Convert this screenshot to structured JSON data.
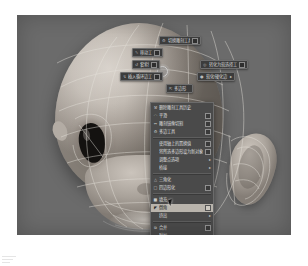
{
  "app": {
    "viewport_background": "#6b6b6b",
    "menu_background": "#4a4a4a",
    "menu_border": "#6b6b6b",
    "highlight_color": "#b9b4ac",
    "text_color": "#dedede"
  },
  "marking_menu": {
    "name": "marking-menu",
    "center_label": "",
    "items": [
      {
        "id": "mm-top",
        "icon": "wrench-icon",
        "label": "切换雕刻工具",
        "has_box": true,
        "left": 142,
        "top": 21,
        "width": 42
      },
      {
        "id": "mm-upper-left",
        "icon": "brush-icon",
        "label": "移动工具",
        "has_box": true,
        "left": 115,
        "top": 33,
        "width": 31
      },
      {
        "id": "mm-left-2",
        "icon": "lasso-icon",
        "label": "套索键",
        "has_box": true,
        "left": 115,
        "top": 45,
        "width": 28
      },
      {
        "id": "mm-left-3",
        "icon": "insert-icon",
        "label": "插入循环边工具",
        "has_box": true,
        "left": 103,
        "top": 57,
        "width": 43
      },
      {
        "id": "mm-right-1",
        "icon": "target-icon",
        "label": "转化为软选择工具",
        "has_box": true,
        "left": 183,
        "top": 45,
        "width": 48
      },
      {
        "id": "mm-right-2",
        "icon": "paint-icon",
        "label": "软化/硬化边",
        "has_box": false,
        "left": 180,
        "top": 57,
        "width": 38
      },
      {
        "id": "mm-bottom",
        "icon": "arrow-icon",
        "label": "多边形",
        "has_box": false,
        "left": 149,
        "top": 69,
        "width": 27
      }
    ]
  },
  "context_menu": {
    "name": "polygon-context-menu",
    "items": [
      {
        "id": "ci-1",
        "icon": "sculpt-icon",
        "label": "删除雕刻工具历史",
        "box": false,
        "arrow": false,
        "indent": false,
        "selected": false,
        "separator_after": false
      },
      {
        "id": "ci-2",
        "icon": "smooth-icon",
        "label": "平滑",
        "box": true,
        "arrow": false,
        "indent": false,
        "selected": false,
        "separator_after": false
      },
      {
        "id": "ci-3",
        "icon": "mirror-icon",
        "label": "雕刻镜像切割",
        "box": true,
        "arrow": false,
        "indent": false,
        "selected": false,
        "separator_after": false
      },
      {
        "id": "ci-4",
        "icon": "tool-icon",
        "label": "多边工具",
        "box": true,
        "arrow": false,
        "indent": false,
        "selected": false,
        "separator_after": true
      },
      {
        "id": "ci-5",
        "icon": "",
        "label": "使用轴上的置换值",
        "box": true,
        "arrow": false,
        "indent": true,
        "selected": false,
        "separator_after": false
      },
      {
        "id": "ci-6",
        "icon": "",
        "label": "将所选多边形设为新对象",
        "box": true,
        "arrow": false,
        "indent": true,
        "selected": false,
        "separator_after": false
      },
      {
        "id": "ci-7",
        "icon": "",
        "label": "调整点选项",
        "box": false,
        "arrow": true,
        "indent": true,
        "selected": false,
        "separator_after": false
      },
      {
        "id": "ci-8",
        "icon": "",
        "label": "桥接",
        "box": false,
        "arrow": true,
        "indent": true,
        "selected": false,
        "separator_after": true
      },
      {
        "id": "ci-9",
        "icon": "tri-icon",
        "label": "三角化",
        "box": false,
        "arrow": false,
        "indent": false,
        "selected": false,
        "separator_after": false
      },
      {
        "id": "ci-10",
        "icon": "quad-icon",
        "label": "四边形化",
        "box": true,
        "arrow": false,
        "indent": false,
        "selected": false,
        "separator_after": true
      },
      {
        "id": "ci-11",
        "icon": "fill-icon",
        "label": "填充",
        "box": false,
        "arrow": false,
        "indent": false,
        "selected": false,
        "separator_after": false
      },
      {
        "id": "ci-12",
        "icon": "bevel-icon",
        "label": "倒角",
        "box": true,
        "arrow": false,
        "indent": false,
        "selected": true,
        "separator_after": false
      },
      {
        "id": "ci-13",
        "icon": "",
        "label": "挤出",
        "box": false,
        "arrow": true,
        "indent": true,
        "selected": false,
        "separator_after": true
      },
      {
        "id": "ci-14",
        "icon": "merge-icon",
        "label": "合并",
        "box": true,
        "arrow": false,
        "indent": false,
        "selected": false,
        "separator_after": false
      },
      {
        "id": "ci-15",
        "icon": "",
        "label": "附加",
        "box": false,
        "arrow": false,
        "indent": true,
        "selected": false,
        "separator_after": false
      },
      {
        "id": "ci-16",
        "icon": "",
        "label": "连接工具",
        "box": true,
        "arrow": false,
        "indent": true,
        "selected": false,
        "separator_after": false
      },
      {
        "id": "ci-17",
        "icon": "",
        "label": "多边形倒角工具",
        "box": true,
        "arrow": false,
        "indent": true,
        "selected": false,
        "separator_after": false
      },
      {
        "id": "ci-18",
        "icon": "",
        "label": "重划分网格",
        "box": false,
        "arrow": true,
        "indent": true,
        "selected": false,
        "separator_after": false
      }
    ]
  }
}
